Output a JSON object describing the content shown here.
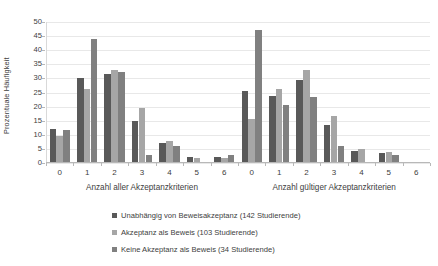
{
  "chart_data": {
    "type": "bar",
    "title": "",
    "subtitle": "",
    "xlabel": "",
    "ylabel": "Prozentuale Häufigkeit",
    "ylim": [
      0,
      50
    ],
    "yticks": [
      0,
      5,
      10,
      15,
      20,
      25,
      30,
      35,
      40,
      45,
      50
    ],
    "grid": true,
    "legend_position": "bottom",
    "panels": [
      {
        "label": "Anzahl aller Akzeptanzkriterien",
        "categories": [
          "0",
          "1",
          "2",
          "3",
          "4",
          "5",
          "6"
        ],
        "series": [
          {
            "name": "Unabhängig von Beweisakzeptanz (142 Studierende)",
            "values": [
              12.0,
              30.3,
              31.7,
              14.8,
              7.0,
              2.1,
              2.1
            ]
          },
          {
            "name": "Akzeptanz als Beweis (103 Studierende)",
            "values": [
              9.7,
              26.2,
              32.9,
              19.4,
              7.7,
              1.9,
              1.9
            ]
          },
          {
            "name": "Keine Akzeptanz als Beweis (34 Studierende)",
            "values": [
              11.7,
              44.1,
              32.3,
              2.9,
              5.9,
              0.0,
              2.9
            ]
          }
        ]
      },
      {
        "label": "Anzahl gültiger Akzeptanzkriterien",
        "categories": [
          "0",
          "1",
          "2",
          "3",
          "4",
          "5",
          "6"
        ],
        "series": [
          {
            "name": "Unabhängig von Beweisakzeptanz (142 Studierende)",
            "values": [
              25.4,
              23.9,
              29.6,
              13.4,
              4.2,
              3.5,
              0.0
            ]
          },
          {
            "name": "Akzeptanz als Beweis (103 Studierende)",
            "values": [
              15.5,
              26.2,
              33.0,
              16.5,
              4.9,
              3.9,
              0.0
            ]
          },
          {
            "name": "Keine Akzeptanz als Beweis (34 Studierende)",
            "values": [
              47.1,
              20.6,
              23.5,
              5.9,
              0.0,
              2.9,
              0.0
            ]
          }
        ]
      }
    ],
    "series_colors": [
      "#595959",
      "#a6a6a6",
      "#808080"
    ],
    "legend": [
      {
        "label": "Unabhängig von Beweisakzeptanz (142 Studierende)",
        "color": "#595959"
      },
      {
        "label": "Akzeptanz als Beweis (103 Studierende)",
        "color": "#a6a6a6"
      },
      {
        "label": "Keine Akzeptanz als Beweis (34 Studierende)",
        "color": "#808080"
      }
    ]
  }
}
